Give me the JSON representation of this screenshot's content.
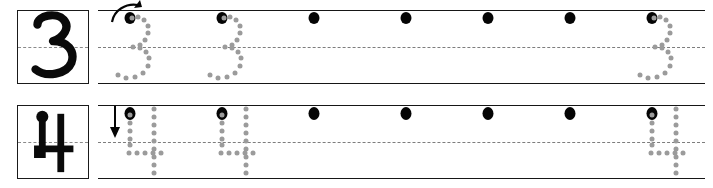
{
  "document": {
    "type": "handwriting-tracing-worksheet",
    "subject": "numeral formation practice",
    "page_width": 713,
    "page_height": 188
  },
  "colors": {
    "rule_line": "#161616",
    "midline": "#7d7d7d",
    "start_dot": "#050505",
    "guide_dot": "#9b9b9b",
    "box_border": "#1a1a1a",
    "paper": "#ffffff"
  },
  "rows": [
    {
      "id": "row-three",
      "numeral": "3",
      "model_label": "3",
      "stroke_arrow": "curved-arrow-up-right",
      "arrow_direction": "curve right then down",
      "start_dot_count": 7,
      "start_dot_x": [
        130,
        222,
        314,
        406,
        488,
        570,
        652
      ],
      "traced_example_x": [
        130,
        222,
        652
      ],
      "band": {
        "x": 98,
        "y": 6,
        "width": 607,
        "height": 74
      }
    },
    {
      "id": "row-four",
      "numeral": "4",
      "model_label": "4",
      "stroke_arrow": "straight-arrow-down",
      "arrow_direction": "down",
      "start_dot_count": 7,
      "start_dot_x": [
        130,
        222,
        314,
        406,
        488,
        570,
        652
      ],
      "traced_example_x": [
        130,
        222,
        652
      ],
      "band": {
        "x": 98,
        "y": 6,
        "width": 607,
        "height": 74
      }
    }
  ],
  "glyph_paths": {
    "three_model": "M 20 14 C 20 5, 38 2, 46 8 C 54 14, 50 26, 38 31 C 52 31, 58 42, 54 52 C 49 64, 28 68, 18 60",
    "four_model_vertical": "M 34 10 L 34 66",
    "four_model_diagonal": "M 34 10 L 20 44 L 56 44",
    "four_model_dot": "dot-at-top-of-stem"
  },
  "guide_dot_patterns": {
    "three": [
      [
        2,
        2
      ],
      [
        8,
        1
      ],
      [
        14,
        4
      ],
      [
        18,
        10
      ],
      [
        18,
        17
      ],
      [
        15,
        24
      ],
      [
        10,
        29
      ],
      [
        3,
        31
      ],
      [
        10,
        32
      ],
      [
        16,
        36
      ],
      [
        19,
        42
      ],
      [
        18,
        50
      ],
      [
        13,
        57
      ],
      [
        5,
        61
      ],
      [
        -4,
        62
      ],
      [
        -12,
        59
      ]
    ],
    "four_left_stem": [
      [
        0,
        4
      ],
      [
        0,
        12
      ],
      [
        0,
        20
      ],
      [
        0,
        28
      ],
      [
        0,
        34
      ]
    ],
    "four_crossbar": [
      [
        -1,
        42
      ],
      [
        7,
        42
      ],
      [
        15,
        42
      ],
      [
        23,
        42
      ],
      [
        31,
        42
      ]
    ],
    "four_vertical": [
      [
        24,
        2
      ],
      [
        24,
        10
      ],
      [
        24,
        18
      ],
      [
        24,
        26
      ],
      [
        24,
        34
      ],
      [
        24,
        42
      ],
      [
        24,
        50
      ],
      [
        24,
        58
      ],
      [
        24,
        66
      ]
    ]
  }
}
